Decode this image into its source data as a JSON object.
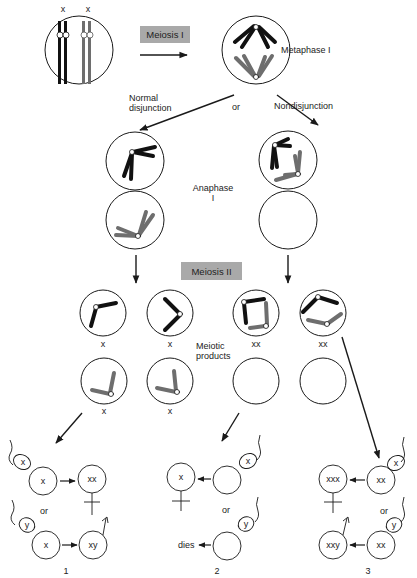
{
  "colors": {
    "line": "#1a1a1a",
    "chromosome_dark": "#111111",
    "chromosome_gray": "#6e6e6e",
    "box_fill": "#a9a9a9",
    "background": "#ffffff"
  },
  "labels": {
    "top_x1": "x",
    "top_x2": "x",
    "meiosis_1": "Meiosis I",
    "metaphase_1": "Metaphase I",
    "normal_line1": "Normal",
    "normal_line2": "disjunction",
    "or_top": "or",
    "nondisjunction": "Nondisjunction",
    "anaphase_line1": "Anaphase",
    "anaphase_line2": "I",
    "meiosis_2": "Meiosis II",
    "meiotic_line1": "Meiotic",
    "meiotic_line2": "products"
  },
  "products": {
    "row1": [
      "x",
      "x",
      "xx",
      "xx"
    ],
    "row2": [
      "x",
      "x"
    ]
  },
  "outcomes": [
    {
      "number": "1",
      "top": {
        "sperm": "x",
        "egg": "x",
        "result": "xx",
        "sex": "female"
      },
      "or": "or",
      "bottom": {
        "sperm": "y",
        "egg": "x",
        "result": "xy",
        "sex": "male"
      }
    },
    {
      "number": "2",
      "top": {
        "sperm": "x",
        "egg": "",
        "result": "x",
        "sex": "female"
      },
      "or": "or",
      "bottom": {
        "sperm": "y",
        "egg": "",
        "result": "dies"
      }
    },
    {
      "number": "3",
      "top": {
        "sperm": "x",
        "egg": "xx",
        "result": "xxx",
        "sex": "female"
      },
      "or": "or",
      "bottom": {
        "sperm": "y",
        "egg": "xx",
        "result": "xxy",
        "sex": "male"
      }
    }
  ]
}
